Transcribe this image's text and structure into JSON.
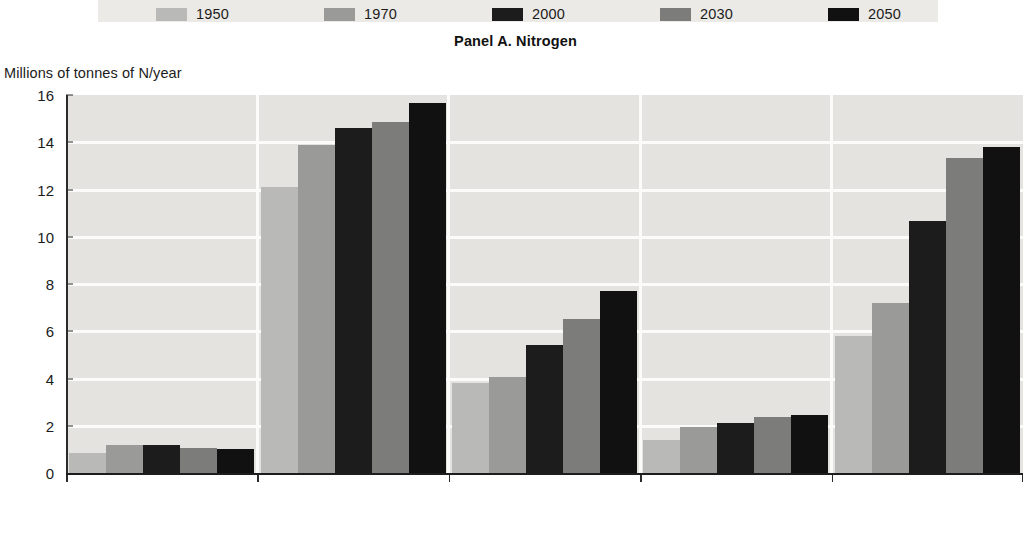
{
  "panel": {
    "title": "Panel A. Nitrogen",
    "y_axis_caption": "Millions of tonnes of N/year"
  },
  "legend": {
    "position": "top",
    "items": [
      {
        "label": "1950",
        "color": "#b9b9b7"
      },
      {
        "label": "1970",
        "color": "#9a9a98"
      },
      {
        "label": "2000",
        "color": "#1c1c1c"
      },
      {
        "label": "2030",
        "color": "#7c7c7a"
      },
      {
        "label": "2050",
        "color": "#111111"
      }
    ]
  },
  "chart_data": {
    "type": "bar",
    "title": "Panel A. Nitrogen",
    "xlabel": "",
    "ylabel": "Millions of tonnes of N/year",
    "ylim": [
      0,
      16
    ],
    "yticks": [
      0,
      2,
      4,
      6,
      8,
      10,
      12,
      14,
      16
    ],
    "ytick_labels": [
      "0",
      "2",
      "4",
      "6",
      "8",
      "10",
      "12",
      "14",
      "16"
    ],
    "grid": true,
    "legend_position": "top",
    "categories": [
      "Arctic Ocean",
      "Atlantic Ocean",
      "Indian Ocean",
      "Mediterranean + Black Sea",
      "Pacific Ocean"
    ],
    "category_labels": [
      [
        "Arctic Ocean"
      ],
      [
        "Atlantic Ocean"
      ],
      [
        "Indian Ocean"
      ],
      [
        "Mediterranean",
        "+ Black Sea"
      ],
      [
        "Pacific Ocean"
      ]
    ],
    "series": [
      {
        "name": "1950",
        "color": "#b9b9b7",
        "values": [
          0.85,
          12.1,
          3.8,
          1.4,
          5.8
        ]
      },
      {
        "name": "1970",
        "color": "#9a9a98",
        "values": [
          1.2,
          13.9,
          4.05,
          1.95,
          7.2
        ]
      },
      {
        "name": "2000",
        "color": "#1c1c1c",
        "values": [
          1.2,
          14.6,
          5.4,
          2.1,
          10.65
        ]
      },
      {
        "name": "2030",
        "color": "#7c7c7a",
        "values": [
          1.05,
          14.85,
          6.5,
          2.35,
          13.35
        ]
      },
      {
        "name": "2050",
        "color": "#111111",
        "values": [
          1.0,
          15.65,
          7.7,
          2.45,
          13.8
        ]
      }
    ]
  }
}
